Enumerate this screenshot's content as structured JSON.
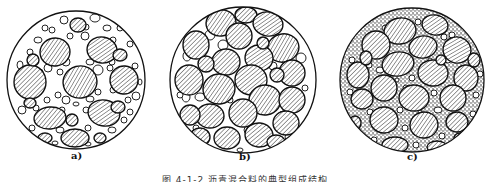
{
  "figure": {
    "caption": "图 4-1-2  沥青混合料的典型组成结构",
    "panels": [
      {
        "label": "a)",
        "description": "suspended-dense structure: coarse aggregate floating in abundant fine aggregate",
        "circle": {
          "cx": 76,
          "cy": 80,
          "r": 69
        },
        "label_pos": {
          "x": 71,
          "y": 156
        },
        "large": [
          [
            55,
            52,
            15,
            14,
            -10
          ],
          [
            102,
            50,
            15,
            13,
            10
          ],
          [
            30,
            82,
            16,
            17,
            0
          ],
          [
            80,
            82,
            17,
            16,
            -15
          ],
          [
            124,
            80,
            14,
            14,
            5
          ],
          [
            50,
            118,
            16,
            11,
            -5
          ],
          [
            104,
            113,
            16,
            13,
            10
          ],
          [
            75,
            138,
            14,
            9,
            0
          ],
          [
            78,
            25,
            8,
            7,
            0
          ],
          [
            120,
            55,
            7,
            6,
            0
          ],
          [
            33,
            60,
            6,
            6,
            0
          ],
          [
            72,
            120,
            6,
            6,
            0
          ],
          [
            118,
            107,
            7,
            6,
            0
          ],
          [
            45,
            138,
            7,
            5,
            0
          ],
          [
            100,
            138,
            6,
            5,
            0
          ],
          [
            30,
            103,
            6,
            5,
            0
          ]
        ],
        "small": [
          [
            64,
            20,
            4,
            4
          ],
          [
            95,
            18,
            5,
            4
          ],
          [
            107,
            28,
            4,
            3
          ],
          [
            113,
            40,
            3,
            3
          ],
          [
            120,
            28,
            3,
            3
          ],
          [
            45,
            28,
            3,
            3
          ],
          [
            38,
            40,
            4,
            3
          ],
          [
            30,
            52,
            3,
            3
          ],
          [
            20,
            65,
            3,
            4
          ],
          [
            48,
            68,
            4,
            4
          ],
          [
            60,
            72,
            3,
            3
          ],
          [
            66,
            62,
            4,
            4
          ],
          [
            90,
            62,
            4,
            3
          ],
          [
            98,
            70,
            5,
            5
          ],
          [
            110,
            68,
            3,
            3
          ],
          [
            135,
            66,
            3,
            3
          ],
          [
            136,
            96,
            4,
            4
          ],
          [
            128,
            100,
            3,
            3
          ],
          [
            58,
            95,
            3,
            3
          ],
          [
            66,
            100,
            4,
            4
          ],
          [
            90,
            99,
            4,
            3
          ],
          [
            98,
            92,
            3,
            3
          ],
          [
            113,
            90,
            3,
            3
          ],
          [
            22,
            110,
            4,
            4
          ],
          [
            36,
            108,
            3,
            3
          ],
          [
            62,
            110,
            3,
            3
          ],
          [
            86,
            110,
            3,
            3
          ],
          [
            124,
            120,
            3,
            3
          ],
          [
            130,
            112,
            3,
            3
          ],
          [
            32,
            128,
            3,
            3
          ],
          [
            60,
            130,
            4,
            3
          ],
          [
            88,
            128,
            3,
            3
          ],
          [
            112,
            130,
            4,
            3
          ],
          [
            118,
            138,
            3,
            3
          ],
          [
            88,
            144,
            3,
            2
          ],
          [
            55,
            143,
            3,
            2
          ],
          [
            70,
            36,
            3,
            3
          ],
          [
            85,
            36,
            4,
            4
          ],
          [
            112,
            62,
            3,
            3
          ],
          [
            40,
            72,
            3,
            3
          ],
          [
            26,
            95,
            3,
            3
          ],
          [
            140,
            82,
            2,
            3
          ],
          [
            47,
            100,
            3,
            3
          ],
          [
            76,
            104,
            3,
            2
          ],
          [
            96,
            120,
            2,
            2
          ],
          [
            52,
            30,
            3,
            3
          ],
          [
            86,
            27,
            3,
            3
          ],
          [
            130,
            44,
            3,
            3
          ]
        ]
      },
      {
        "label": "b)",
        "description": "skeleton-void structure: coarse aggregate in contact with little fine aggregate",
        "circle": {
          "cx": 243,
          "cy": 80,
          "r": 73
        },
        "label_pos": {
          "x": 240,
          "y": 157
        },
        "large": [
          [
            221,
            23,
            15,
            13,
            -10
          ],
          [
            246,
            15,
            11,
            8,
            0
          ],
          [
            268,
            24,
            15,
            12,
            10
          ],
          [
            239,
            36,
            13,
            13,
            0
          ],
          [
            196,
            45,
            13,
            14,
            0
          ],
          [
            283,
            48,
            16,
            14,
            -15
          ],
          [
            226,
            62,
            14,
            13,
            0
          ],
          [
            259,
            58,
            14,
            13,
            10
          ],
          [
            292,
            73,
            13,
            13,
            0
          ],
          [
            189,
            80,
            14,
            15,
            0
          ],
          [
            219,
            89,
            16,
            15,
            -10
          ],
          [
            251,
            80,
            16,
            15,
            5
          ],
          [
            265,
            100,
            16,
            15,
            -10
          ],
          [
            292,
            100,
            13,
            13,
            0
          ],
          [
            210,
            116,
            14,
            12,
            0
          ],
          [
            243,
            113,
            14,
            14,
            0
          ],
          [
            190,
            115,
            10,
            10,
            0
          ],
          [
            286,
            123,
            13,
            12,
            0
          ],
          [
            227,
            138,
            13,
            11,
            0
          ],
          [
            259,
            135,
            14,
            12,
            5
          ],
          [
            200,
            137,
            10,
            9,
            0
          ],
          [
            276,
            142,
            9,
            7,
            0
          ],
          [
            206,
            64,
            8,
            8,
            0
          ],
          [
            263,
            43,
            6,
            6,
            0
          ],
          [
            277,
            75,
            7,
            7,
            0
          ]
        ],
        "small": [
          [
            210,
            35,
            5,
            5
          ],
          [
            223,
            45,
            5,
            5
          ],
          [
            187,
            56,
            4,
            5
          ],
          [
            186,
            97,
            4,
            5
          ],
          [
            200,
            97,
            5,
            4
          ],
          [
            283,
            115,
            4,
            4
          ],
          [
            301,
            58,
            5,
            5
          ],
          [
            248,
            130,
            4,
            4
          ],
          [
            230,
            100,
            3,
            3
          ],
          [
            273,
            66,
            4,
            4
          ],
          [
            196,
            128,
            3,
            3
          ],
          [
            305,
            88,
            3,
            3
          ],
          [
            180,
            95,
            3,
            3
          ],
          [
            240,
            150,
            3,
            2
          ],
          [
            288,
            137,
            3,
            3
          ]
        ]
      },
      {
        "label": "c)",
        "description": "dense-skeleton structure: coarse aggregate skeleton with voids filled by fine aggregate",
        "circle": {
          "cx": 412,
          "cy": 80,
          "r": 72
        },
        "label_pos": {
          "x": 408,
          "y": 157
        },
        "large": [
          [
            400,
            31,
            16,
            13,
            -10
          ],
          [
            435,
            25,
            13,
            10,
            10
          ],
          [
            376,
            45,
            14,
            14,
            0
          ],
          [
            423,
            47,
            14,
            11,
            -10
          ],
          [
            457,
            50,
            14,
            13,
            15
          ],
          [
            398,
            64,
            16,
            12,
            -10
          ],
          [
            433,
            73,
            15,
            13,
            5
          ],
          [
            358,
            75,
            11,
            13,
            0
          ],
          [
            466,
            78,
            12,
            13,
            0
          ],
          [
            384,
            88,
            13,
            13,
            0
          ],
          [
            414,
            98,
            15,
            13,
            0
          ],
          [
            453,
            98,
            13,
            13,
            0
          ],
          [
            362,
            99,
            11,
            10,
            0
          ],
          [
            384,
            120,
            14,
            13,
            5
          ],
          [
            424,
            125,
            14,
            13,
            -10
          ],
          [
            457,
            122,
            11,
            10,
            0
          ],
          [
            395,
            145,
            13,
            8,
            0
          ],
          [
            437,
            147,
            10,
            6,
            0
          ],
          [
            355,
            123,
            6,
            7,
            0
          ],
          [
            441,
            60,
            5,
            5,
            0
          ],
          [
            366,
            58,
            6,
            7,
            0
          ],
          [
            474,
            60,
            6,
            7,
            0
          ],
          [
            460,
            138,
            6,
            5,
            0
          ]
        ],
        "small": [
          [
            418,
            22,
            3,
            3
          ],
          [
            386,
            28,
            4,
            3
          ],
          [
            452,
            35,
            3,
            3
          ],
          [
            420,
            40,
            3,
            3
          ],
          [
            444,
            37,
            3,
            3
          ],
          [
            412,
            52,
            2,
            2
          ],
          [
            369,
            65,
            3,
            3
          ],
          [
            380,
            70,
            4,
            3
          ],
          [
            412,
            78,
            3,
            3
          ],
          [
            448,
            60,
            3,
            3
          ],
          [
            480,
            74,
            3,
            3
          ],
          [
            476,
            95,
            3,
            3
          ],
          [
            406,
            88,
            3,
            3
          ],
          [
            434,
            93,
            3,
            3
          ],
          [
            370,
            112,
            3,
            3
          ],
          [
            400,
            110,
            3,
            3
          ],
          [
            438,
            110,
            4,
            3
          ],
          [
            473,
            114,
            3,
            3
          ],
          [
            405,
            128,
            3,
            3
          ],
          [
            442,
            136,
            3,
            3
          ],
          [
            374,
            140,
            3,
            3
          ],
          [
            416,
            145,
            3,
            3
          ],
          [
            350,
            92,
            3,
            3
          ],
          [
            352,
            60,
            3,
            3
          ],
          [
            430,
            60,
            2,
            2
          ],
          [
            397,
            80,
            2,
            2
          ],
          [
            456,
            80,
            2,
            2
          ],
          [
            420,
            112,
            2,
            2
          ]
        ],
        "fines": true
      }
    ]
  }
}
